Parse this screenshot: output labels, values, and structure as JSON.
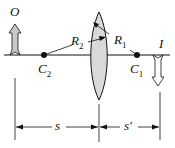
{
  "diagram": {
    "type": "thin lens geometry",
    "labels": {
      "object": "O",
      "image": "I",
      "c1": "C",
      "c1_sub": "1",
      "c2": "C",
      "c2_sub": "2",
      "r1": "R",
      "r1_sub": "1",
      "r2": "R",
      "r2_sub": "2",
      "s": "s",
      "s_prime": "s′"
    },
    "colors": {
      "line": "#111111",
      "lens_fill": "#d9d9d9",
      "arrow_fill": "#c8c8c8"
    }
  }
}
